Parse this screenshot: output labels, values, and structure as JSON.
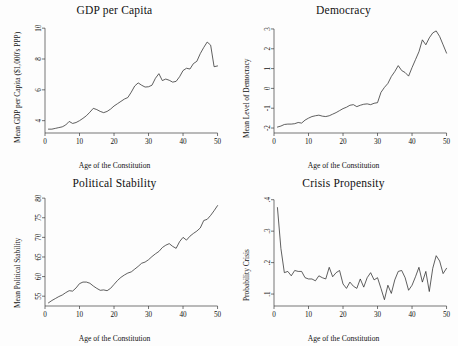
{
  "figure": {
    "width": 458,
    "height": 346,
    "background": "#fdfdfd",
    "line_color": "#2b2b2b",
    "axis_color": "#3a3a3a",
    "shared_xlabel": "Age of the Constitution"
  },
  "chart_data": [
    {
      "type": "line",
      "title": "GDP per Capita",
      "xlabel": "Age of the Constitution",
      "ylabel": "Mean GDP per Capita ($1,000's PPP)",
      "xlim": [
        0,
        51
      ],
      "ylim": [
        3.2,
        10.4
      ],
      "xticks": [
        0,
        10,
        20,
        30,
        40,
        50
      ],
      "yticks": [
        4,
        6,
        8,
        10
      ],
      "grid": false,
      "legend": "none",
      "x": [
        1,
        2,
        3,
        4,
        5,
        6,
        7,
        8,
        9,
        10,
        11,
        12,
        13,
        14,
        15,
        16,
        17,
        18,
        19,
        20,
        21,
        22,
        23,
        24,
        25,
        26,
        27,
        28,
        29,
        30,
        31,
        32,
        33,
        34,
        35,
        36,
        37,
        38,
        39,
        40,
        41,
        42,
        43,
        44,
        45,
        46,
        47,
        48,
        49,
        50
      ],
      "values": [
        3.45,
        3.45,
        3.5,
        3.55,
        3.6,
        3.72,
        3.95,
        3.82,
        3.88,
        4.0,
        4.15,
        4.32,
        4.55,
        4.8,
        4.72,
        4.6,
        4.52,
        4.6,
        4.75,
        4.95,
        5.1,
        5.25,
        5.4,
        5.5,
        5.85,
        6.25,
        6.45,
        6.3,
        6.18,
        6.2,
        6.3,
        6.75,
        7.05,
        6.6,
        6.7,
        6.62,
        6.5,
        6.55,
        6.85,
        7.25,
        7.4,
        7.35,
        7.7,
        7.85,
        8.35,
        8.75,
        9.1,
        8.9,
        7.5,
        7.55
      ]
    },
    {
      "type": "line",
      "title": "Democracy",
      "xlabel": "Age of the Constitution",
      "ylabel": "Mean Level of Democracy",
      "xlim": [
        0,
        51
      ],
      "ylim": [
        -2.25,
        3.35
      ],
      "xticks": [
        0,
        10,
        20,
        30,
        40,
        50
      ],
      "yticks": [
        -2,
        -1,
        0,
        1,
        2,
        3
      ],
      "grid": false,
      "legend": "none",
      "x": [
        1,
        2,
        3,
        4,
        5,
        6,
        7,
        8,
        9,
        10,
        11,
        12,
        13,
        14,
        15,
        16,
        17,
        18,
        19,
        20,
        21,
        22,
        23,
        24,
        25,
        26,
        27,
        28,
        29,
        30,
        31,
        32,
        33,
        34,
        35,
        36,
        37,
        38,
        39,
        40,
        41,
        42,
        43,
        44,
        45,
        46,
        47,
        48,
        49,
        50
      ],
      "values": [
        -1.95,
        -1.9,
        -1.82,
        -1.8,
        -1.8,
        -1.78,
        -1.72,
        -1.75,
        -1.6,
        -1.5,
        -1.42,
        -1.38,
        -1.35,
        -1.4,
        -1.42,
        -1.38,
        -1.3,
        -1.22,
        -1.12,
        -1.02,
        -0.95,
        -0.85,
        -0.82,
        -0.92,
        -0.85,
        -0.8,
        -0.78,
        -0.82,
        -0.75,
        -0.72,
        -0.2,
        0.05,
        0.25,
        0.6,
        0.85,
        1.15,
        0.9,
        0.8,
        0.62,
        1.05,
        1.45,
        1.85,
        2.45,
        2.2,
        2.55,
        2.8,
        2.9,
        2.62,
        2.2,
        1.78
      ]
    },
    {
      "type": "line",
      "title": "Political Stability",
      "xlabel": "Age of the Constitution",
      "ylabel": "Mean Political Stability",
      "xlim": [
        0,
        51
      ],
      "ylim": [
        52.5,
        80.8
      ],
      "xticks": [
        0,
        10,
        20,
        30,
        40,
        50
      ],
      "yticks": [
        55,
        60,
        65,
        70,
        75,
        80
      ],
      "grid": false,
      "legend": "none",
      "x": [
        1,
        2,
        3,
        4,
        5,
        6,
        7,
        8,
        9,
        10,
        11,
        12,
        13,
        14,
        15,
        16,
        17,
        18,
        19,
        20,
        21,
        22,
        23,
        24,
        25,
        26,
        27,
        28,
        29,
        30,
        31,
        32,
        33,
        34,
        35,
        36,
        37,
        38,
        39,
        40,
        41,
        42,
        43,
        44,
        45,
        46,
        47,
        48,
        49,
        50
      ],
      "values": [
        53.3,
        53.9,
        54.4,
        54.9,
        55.3,
        55.9,
        56.4,
        56.3,
        57.1,
        58.2,
        58.6,
        58.6,
        58.3,
        57.6,
        57.0,
        56.5,
        56.6,
        56.4,
        57.0,
        58.0,
        59.0,
        59.8,
        60.4,
        60.9,
        61.2,
        61.9,
        62.6,
        63.4,
        63.7,
        64.3,
        65.1,
        65.8,
        66.4,
        67.4,
        68.0,
        68.4,
        67.7,
        67.2,
        68.9,
        70.0,
        69.3,
        70.3,
        71.0,
        71.6,
        72.4,
        74.3,
        74.6,
        75.6,
        76.8,
        78.1
      ]
    },
    {
      "type": "line",
      "title": "Crisis Propensity",
      "xlabel": "Age of the Constitution",
      "ylabel": "Probability Crisis",
      "xlim": [
        0,
        51
      ],
      "ylim": [
        0.062,
        0.415
      ],
      "xticks": [
        0,
        10,
        20,
        30,
        40,
        50
      ],
      "yticks": [
        0.1,
        0.2,
        0.3,
        0.4
      ],
      "ytick_labels": [
        ".1",
        ".2",
        ".3",
        ".4"
      ],
      "grid": false,
      "legend": "none",
      "x": [
        1,
        2,
        3,
        4,
        5,
        6,
        7,
        8,
        9,
        10,
        11,
        12,
        13,
        14,
        15,
        16,
        17,
        18,
        19,
        20,
        21,
        22,
        23,
        24,
        25,
        26,
        27,
        28,
        29,
        30,
        31,
        32,
        33,
        34,
        35,
        36,
        37,
        38,
        39,
        40,
        41,
        42,
        43,
        44,
        45,
        46,
        47,
        48,
        49,
        50
      ],
      "values": [
        0.375,
        0.245,
        0.168,
        0.172,
        0.158,
        0.175,
        0.172,
        0.172,
        0.152,
        0.148,
        0.148,
        0.142,
        0.158,
        0.152,
        0.148,
        0.185,
        0.155,
        0.168,
        0.175,
        0.132,
        0.118,
        0.138,
        0.125,
        0.118,
        0.148,
        0.122,
        0.152,
        0.168,
        0.145,
        0.152,
        0.118,
        0.082,
        0.128,
        0.102,
        0.145,
        0.172,
        0.175,
        0.152,
        0.112,
        0.128,
        0.155,
        0.185,
        0.138,
        0.172,
        0.108,
        0.182,
        0.222,
        0.205,
        0.165,
        0.182
      ]
    }
  ]
}
